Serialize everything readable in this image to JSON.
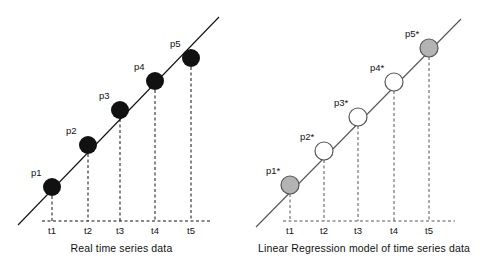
{
  "figure": {
    "title": "",
    "background": "#ffffff",
    "width": 485,
    "height": 271
  },
  "colors": {
    "stroke": "#111111",
    "filled_marker": "#111111",
    "open_marker": "#ffffff",
    "gray_marker": "#b3b3b3",
    "dashed_guide": "#111111",
    "text": "#111111"
  },
  "panels": [
    {
      "id": "real-time-series",
      "caption": "Real time series data",
      "trend_line": {
        "x1": 18,
        "y1": 225,
        "x2": 219,
        "y2": 17
      },
      "baseline": {
        "x1": 42,
        "y1": 221,
        "x2": 210,
        "y2": 221
      },
      "tick_labels": [
        "t1",
        "t2",
        "t3",
        "t4",
        "t5"
      ],
      "point_labels": [
        "p1",
        "p2",
        "p3",
        "p4",
        "p5"
      ],
      "marker_style": "filled",
      "marker_radius": 9,
      "points": [
        {
          "label": "p1",
          "tick": "t1",
          "cx": 52,
          "cy": 187,
          "label_x": 31,
          "label_y": 173
        },
        {
          "label": "p2",
          "tick": "t2",
          "cx": 88,
          "cy": 145,
          "label_x": 66,
          "label_y": 130
        },
        {
          "label": "p3",
          "tick": "t3",
          "cx": 120,
          "cy": 110,
          "label_x": 99,
          "label_y": 96
        },
        {
          "label": "p4",
          "tick": "t4",
          "cx": 155,
          "cy": 81,
          "label_x": 134,
          "label_y": 66
        },
        {
          "label": "p5",
          "tick": "t5",
          "cx": 191,
          "cy": 58,
          "label_x": 169,
          "label_y": 43
        }
      ]
    },
    {
      "id": "linear-regression-model",
      "caption": "Linear Regression model of time series data",
      "trend_line": {
        "x1": 13,
        "y1": 227,
        "x2": 218,
        "y2": 19
      },
      "baseline": {
        "x1": 40,
        "y1": 221,
        "x2": 212,
        "y2": 221
      },
      "tick_labels": [
        "t1",
        "t2",
        "t3",
        "t4",
        "t5"
      ],
      "point_labels": [
        "p1*",
        "p2*",
        "p3*",
        "p4*",
        "p5*"
      ],
      "marker_style": "open",
      "marker_radius": 9,
      "points": [
        {
          "label": "p1",
          "tick": "t1",
          "cx": 47,
          "cy": 185,
          "label_x": 23,
          "label_y": 170,
          "fill": "gray"
        },
        {
          "label": "p2",
          "tick": "t2",
          "cx": 81,
          "cy": 151,
          "label_x": 57,
          "label_y": 136,
          "fill": "white"
        },
        {
          "label": "p3",
          "tick": "t3",
          "cx": 115,
          "cy": 117,
          "label_x": 91,
          "label_y": 102,
          "fill": "white"
        },
        {
          "label": "p4",
          "tick": "t4",
          "cx": 151,
          "cy": 82,
          "label_x": 127,
          "label_y": 67,
          "fill": "white"
        },
        {
          "label": "p5",
          "tick": "t5",
          "cx": 186,
          "cy": 48,
          "label_x": 162,
          "label_y": 33,
          "fill": "gray"
        }
      ]
    }
  ]
}
